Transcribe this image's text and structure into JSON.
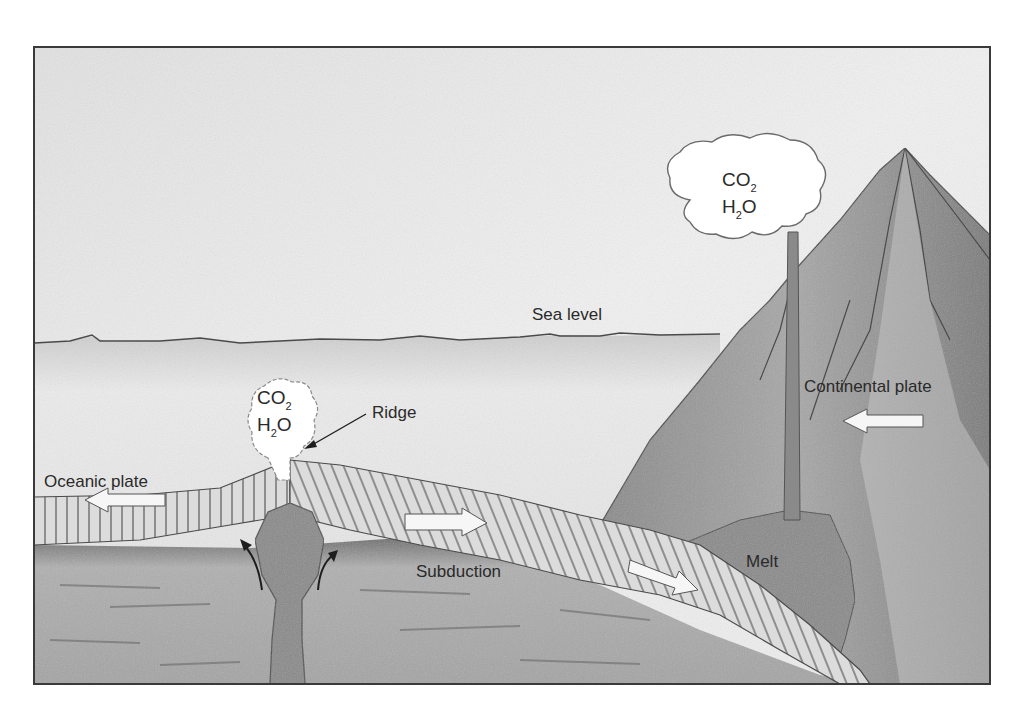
{
  "diagram": {
    "type": "cross-section illustration",
    "colors": {
      "frame": "#3a3a3a",
      "sky": "#efefef",
      "ocean": "#e3e3e3",
      "mantle": "#9c9c9c",
      "plate": "#dcdcdc",
      "plate_lines": "#5a5a5a",
      "magma": "#8a8a8a",
      "mountain": "#8e8e8e",
      "mountain_light": "#bdbdbd",
      "cloud": "#ffffff",
      "text": "#2a2a2a"
    }
  },
  "labels": {
    "sea_level": "Sea level",
    "ridge": "Ridge",
    "oceanic_plate": "Oceanic plate",
    "continental_plate": "Continental plate",
    "subduction": "Subduction",
    "melt": "Melt"
  },
  "gas_clouds": {
    "volcano": {
      "line1_main": "CO",
      "line1_sub": "2",
      "line2_pre": "H",
      "line2_sub": "2",
      "line2_post": "O"
    },
    "ridge": {
      "line1_main": "CO",
      "line1_sub": "2",
      "line2_pre": "H",
      "line2_sub": "2",
      "line2_post": "O"
    }
  },
  "arrows": {
    "oceanic_plate_left": "arrow-left",
    "oceanic_plate_right": "arrow-right",
    "subduction_down_right": "arrow-down-right",
    "continental_plate_left": "arrow-left",
    "mantle_upwelling_left": "curved-arrow-up",
    "mantle_upwelling_right": "curved-arrow-up",
    "ridge_pointer": "leader-arrow"
  }
}
